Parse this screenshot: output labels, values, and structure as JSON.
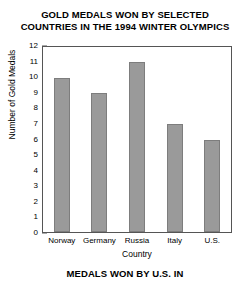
{
  "chart_data": {
    "type": "bar",
    "title": "GOLD MEDALS WON BY SELECTED COUNTRIES IN THE 1994 WINTER OLYMPICS",
    "title_lines": [
      "GOLD MEDALS WON BY SELECTED",
      "COUNTRIES IN THE 1994 WINTER OLYMPICS"
    ],
    "categories": [
      "Norway",
      "Germany",
      "Russia",
      "Italy",
      "U.S."
    ],
    "values": [
      10,
      9,
      11,
      7,
      6
    ],
    "xlabel": "Country",
    "ylabel": "Number of Gold Medals",
    "ylim": [
      0,
      12
    ],
    "ytick_step": 1,
    "yticks": [
      12,
      11,
      10,
      9,
      8,
      7,
      6,
      5,
      4,
      3,
      2,
      1,
      0
    ],
    "grid": false,
    "legend": false,
    "bar_color": "#9a9a9a",
    "bar_edge_color": "#7d7d7d",
    "axis_color": "#555555",
    "background": "#ffffff"
  },
  "caption": {
    "bottom_text": "MEDALS WON BY U.S. IN"
  }
}
